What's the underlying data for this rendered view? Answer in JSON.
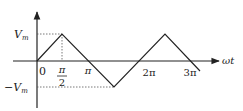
{
  "diagram": {
    "type": "triangular-wave",
    "axis_x_label": "ωt",
    "y_labels": {
      "max": "V",
      "max_sub": "m",
      "min": "−V",
      "min_sub": "m"
    },
    "x_ticks": [
      {
        "text": "0"
      },
      {
        "num": "π",
        "den": "2"
      },
      {
        "text": "π"
      },
      {
        "text": "2π"
      },
      {
        "text": "3π"
      }
    ],
    "colors": {
      "line": "#222222",
      "dotted": "#555555"
    }
  }
}
